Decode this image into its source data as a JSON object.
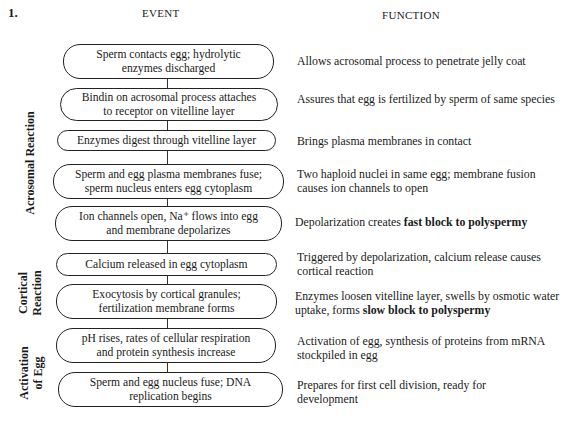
{
  "figure_number": "1.",
  "headers": {
    "event": "EVENT",
    "function": "FUNCTION"
  },
  "phases": [
    {
      "label": "Acrosomal Reaction"
    },
    {
      "label_line1": "Cortical",
      "label_line2": "Reaction"
    },
    {
      "label_line1": "Activation",
      "label_line2": "of Egg"
    }
  ],
  "steps": [
    {
      "event": [
        "Sperm contacts egg; hydrolytic",
        "enzymes discharged"
      ],
      "function": {
        "pre": "Allows acrosomal process to penetrate jelly coat",
        "bold": "",
        "post": ""
      }
    },
    {
      "event": [
        "Bindin on acrosomal process attaches",
        "to receptor on vitelline layer"
      ],
      "function": {
        "pre": "Assures that egg is fertilized by sperm of same species",
        "bold": "",
        "post": ""
      }
    },
    {
      "event": [
        "Enzymes digest through vitelline layer"
      ],
      "function": {
        "pre": "Brings plasma membranes in contact",
        "bold": "",
        "post": ""
      }
    },
    {
      "event": [
        "Sperm and egg plasma membranes fuse;",
        "sperm nucleus enters egg cytoplasm"
      ],
      "function": {
        "pre": "Two haploid nuclei in same egg; membrane fusion causes ion channels to open",
        "bold": "",
        "post": ""
      }
    },
    {
      "event": [
        "Ion channels open, Na⁺ flows into egg",
        "and membrane depolarizes"
      ],
      "function": {
        "pre": "Depolarization creates ",
        "bold": "fast block to polyspermy",
        "post": ""
      }
    },
    {
      "event": [
        "Calcium released in egg cytoplasm"
      ],
      "function": {
        "pre": "Triggered by depolarization, calcium release causes cortical reaction",
        "bold": "",
        "post": ""
      }
    },
    {
      "event": [
        "Exocytosis by cortical granules;",
        "fertilization membrane forms"
      ],
      "function": {
        "pre": "Enzymes loosen vitelline layer, swells by osmotic water uptake, forms ",
        "bold": "slow block to polyspermy",
        "post": ""
      }
    },
    {
      "event": [
        "pH rises, rates of cellular respiration",
        "and protein synthesis increase"
      ],
      "function": {
        "pre": "Activation of egg, synthesis of proteins from mRNA stockpiled in egg",
        "bold": "",
        "post": ""
      }
    },
    {
      "event": [
        "Sperm and egg  nucleus fuse; DNA",
        "replication begins"
      ],
      "function": {
        "pre": "Prepares for first cell division, ready for development",
        "bold": "",
        "post": ""
      }
    }
  ]
}
